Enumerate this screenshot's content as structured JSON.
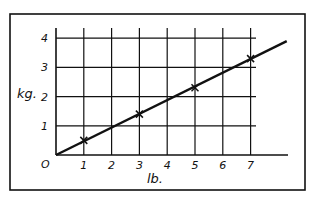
{
  "chart_data": {
    "type": "line",
    "title": "",
    "xlabel": "lb.",
    "ylabel": "kg.",
    "origin_label": "O",
    "x_ticks": [
      1,
      2,
      3,
      4,
      5,
      6,
      7
    ],
    "y_ticks": [
      1,
      2,
      3,
      4
    ],
    "xlim": [
      0,
      8.5
    ],
    "ylim": [
      0,
      4.3
    ],
    "grid": true,
    "legend": null,
    "series": [
      {
        "name": "conversion line",
        "style": "line",
        "x": [
          0,
          8.3
        ],
        "values": [
          0,
          3.9
        ]
      },
      {
        "name": "measured points",
        "style": "x-markers",
        "x": [
          1,
          3,
          5,
          7
        ],
        "values": [
          0.5,
          1.4,
          2.3,
          3.3
        ]
      }
    ],
    "colors": {
      "ink": "#111111",
      "background": "#ffffff"
    }
  }
}
